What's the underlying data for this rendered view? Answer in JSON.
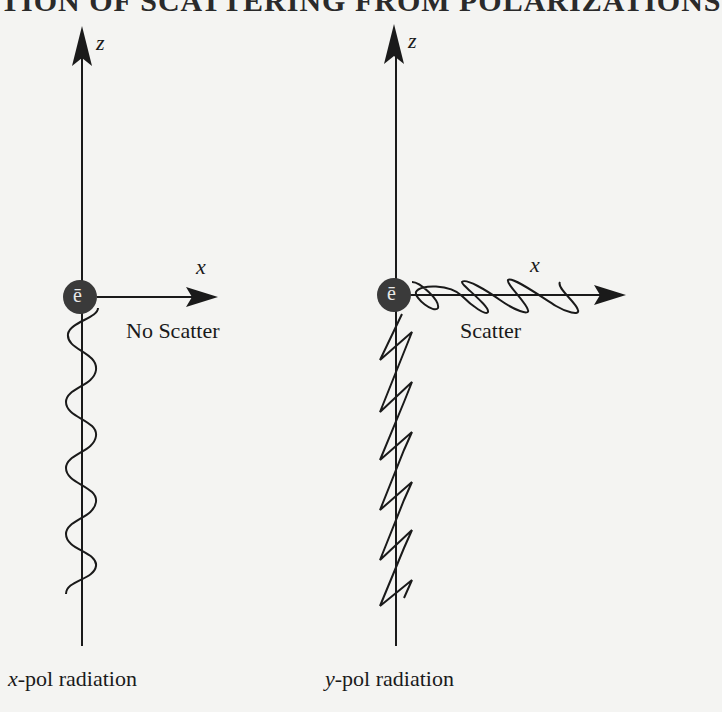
{
  "heading": "TION OF SCATTERING FROM POLARIZATIONS",
  "colors": {
    "background": "#f4f4f2",
    "ink": "#1a1a1a",
    "electron": "#3a3a3a",
    "electron_label": "#e8e8e8"
  },
  "left_panel": {
    "z_axis_label": "z",
    "x_axis_label": "x",
    "electron_label": "ē",
    "outcome_label": "No Scatter",
    "caption_var": "x",
    "caption_text": "-pol radiation"
  },
  "right_panel": {
    "z_axis_label": "z",
    "x_axis_label": "x",
    "electron_label": "ē",
    "outcome_label": "Scatter",
    "caption_var": "y",
    "caption_text": "-pol radiation"
  }
}
